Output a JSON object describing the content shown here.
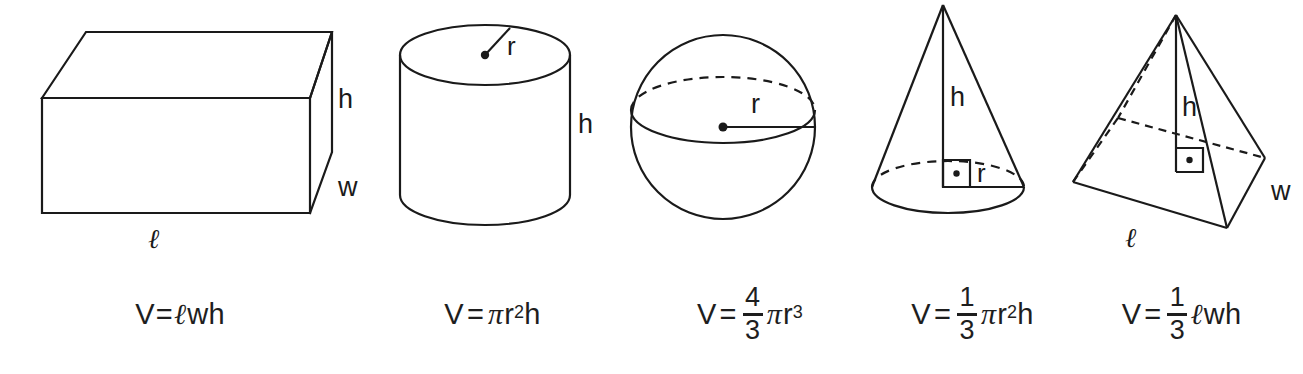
{
  "page": {
    "background_color": "#ffffff",
    "ink_color": "#1a1a1a",
    "width": 1303,
    "height": 374
  },
  "figures": [
    {
      "id": "rectangular-prism",
      "name": "Rectangular Prism",
      "labels": {
        "length": "ℓ",
        "width": "w",
        "height": "h"
      },
      "formula": {
        "text": "V= ℓwh",
        "lhs": "V",
        "equals": "=",
        "terms": [
          "ℓ",
          "w",
          "h"
        ]
      }
    },
    {
      "id": "cylinder",
      "name": "Cylinder",
      "labels": {
        "radius": "r",
        "height": "h"
      },
      "formula": {
        "text": "V = πr²h",
        "lhs": "V",
        "equals": "=",
        "pi": "π",
        "base": "r",
        "exponent": "2",
        "trailing": "h"
      }
    },
    {
      "id": "sphere",
      "name": "Sphere",
      "labels": {
        "radius": "r"
      },
      "formula": {
        "text": "V = 4/3 πr³",
        "lhs": "V",
        "equals": "=",
        "numerator": "4",
        "denominator": "3",
        "pi": "π",
        "base": "r",
        "exponent": "3"
      }
    },
    {
      "id": "cone",
      "name": "Cone",
      "labels": {
        "radius": "r",
        "height": "h"
      },
      "formula": {
        "text": "V = 1/3 πr²h",
        "lhs": "V",
        "equals": "=",
        "numerator": "1",
        "denominator": "3",
        "pi": "π",
        "base": "r",
        "exponent": "2",
        "trailing": "h"
      }
    },
    {
      "id": "pyramid",
      "name": "Rectangular Pyramid",
      "labels": {
        "length": "ℓ",
        "width": "w",
        "height": "h"
      },
      "formula": {
        "text": "V = 1/3 ℓwh",
        "lhs": "V",
        "equals": "=",
        "numerator": "1",
        "denominator": "3",
        "terms": [
          "ℓ",
          "w",
          "h"
        ]
      }
    }
  ]
}
